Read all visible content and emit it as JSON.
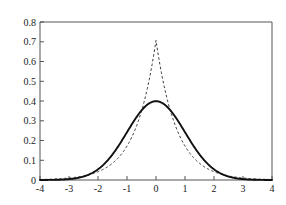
{
  "chart_data": {
    "type": "line",
    "title": "",
    "xlabel": "",
    "ylabel": "",
    "xlim": [
      -4,
      4
    ],
    "ylim": [
      0,
      0.8
    ],
    "grid": false,
    "legend": "none",
    "xticks": [
      -4,
      -3,
      -2,
      -1,
      0,
      1,
      2,
      3,
      4
    ],
    "xtick_labels": [
      "-4",
      "-3",
      "-2",
      "-1",
      "0",
      "1",
      "2",
      "3",
      "4"
    ],
    "yticks": [
      0,
      0.1,
      0.2,
      0.3,
      0.4,
      0.5,
      0.6,
      0.7,
      0.8
    ],
    "ytick_labels": [
      "0",
      "0.1",
      "0.2",
      "0.3",
      "0.4",
      "0.5",
      "0.6",
      "0.7",
      "0.8"
    ],
    "axis_color": "#555555",
    "series": [
      {
        "name": "gaussian",
        "style": "solid",
        "color": "#101010",
        "peak_value": 0.399,
        "peak_x": 0,
        "x": [
          -4,
          -3.8,
          -3.6,
          -3.4,
          -3.2,
          -3,
          -2.8,
          -2.6,
          -2.4,
          -2.2,
          -2,
          -1.8,
          -1.6,
          -1.4,
          -1.2,
          -1,
          -0.8,
          -0.6,
          -0.4,
          -0.2,
          0,
          0.2,
          0.4,
          0.6,
          0.8,
          1,
          1.2,
          1.4,
          1.6,
          1.8,
          2,
          2.2,
          2.4,
          2.6,
          2.8,
          3,
          3.2,
          3.4,
          3.6,
          3.8,
          4
        ],
        "values": [
          0.0001,
          0.0003,
          0.0006,
          0.0012,
          0.0024,
          0.0044,
          0.0079,
          0.0136,
          0.0224,
          0.0355,
          0.054,
          0.079,
          0.1109,
          0.1497,
          0.1942,
          0.242,
          0.2897,
          0.3332,
          0.3683,
          0.391,
          0.3989,
          0.391,
          0.3683,
          0.3332,
          0.2897,
          0.242,
          0.1942,
          0.1497,
          0.1109,
          0.079,
          0.054,
          0.0355,
          0.0224,
          0.0136,
          0.0079,
          0.0044,
          0.0024,
          0.0012,
          0.0006,
          0.0003,
          0.0001
        ]
      },
      {
        "name": "laplace",
        "style": "dashed",
        "color": "#3a3a3a",
        "peak_value": 0.707,
        "peak_x": 0,
        "x": [
          -4,
          -3.8,
          -3.6,
          -3.4,
          -3.2,
          -3,
          -2.8,
          -2.6,
          -2.4,
          -2.2,
          -2,
          -1.8,
          -1.6,
          -1.4,
          -1.2,
          -1,
          -0.8,
          -0.6,
          -0.4,
          -0.2,
          0,
          0.2,
          0.4,
          0.6,
          0.8,
          1,
          1.2,
          1.4,
          1.6,
          1.8,
          2,
          2.2,
          2.4,
          2.6,
          2.8,
          3,
          3.2,
          3.4,
          3.6,
          3.8,
          4
        ],
        "values": [
          0.0024,
          0.0033,
          0.0045,
          0.0062,
          0.0085,
          0.0117,
          0.0161,
          0.022,
          0.0302,
          0.0414,
          0.0567,
          0.0777,
          0.1064,
          0.1458,
          0.1997,
          0.2736,
          0.3748,
          0.5135,
          0.7035,
          0.5135,
          0.7071,
          0.5135,
          0.3748,
          0.2736,
          0.1997,
          0.1458,
          0.1064,
          0.0777,
          0.0567,
          0.0414,
          0.0302,
          0.022,
          0.0161,
          0.0117,
          0.0085,
          0.0062,
          0.0045,
          0.0033,
          0.0024,
          0.0017,
          0.0024
        ]
      }
    ],
    "crossings_x": [
      -0.82,
      0.82
    ]
  }
}
